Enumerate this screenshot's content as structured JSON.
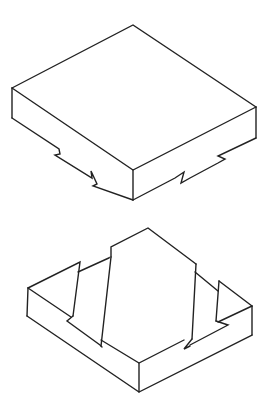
{
  "figure": {
    "description": "Isometric line drawing of two interlocking block pieces: a lid (top) with dovetail notches on its underside edges, and a base (bottom) with a raised central tenon and two triangular side lugs.",
    "stroke_color": "#222222",
    "background_color": "#ffffff"
  },
  "parts": [
    {
      "id": "top-block",
      "label": "Upper block with notched bottom edges"
    },
    {
      "id": "bottom-block",
      "label": "Lower base with central tenon and triangular lugs"
    }
  ]
}
